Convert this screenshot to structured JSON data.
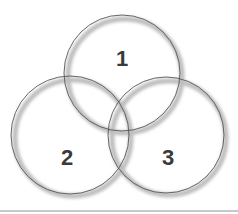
{
  "diagram": {
    "type": "venn",
    "sets": [
      {
        "id": "1",
        "label": "1",
        "cx": 122,
        "cy": 73,
        "r": 58
      },
      {
        "id": "2",
        "label": "2",
        "cx": 70,
        "cy": 135,
        "r": 59
      },
      {
        "id": "3",
        "label": "3",
        "cx": 166,
        "cy": 135,
        "r": 58
      }
    ],
    "colors": {
      "stroke": "#555555",
      "shadow": "#bdbdbd",
      "fill": "#ffffff",
      "label": "#3a3a3a"
    }
  }
}
